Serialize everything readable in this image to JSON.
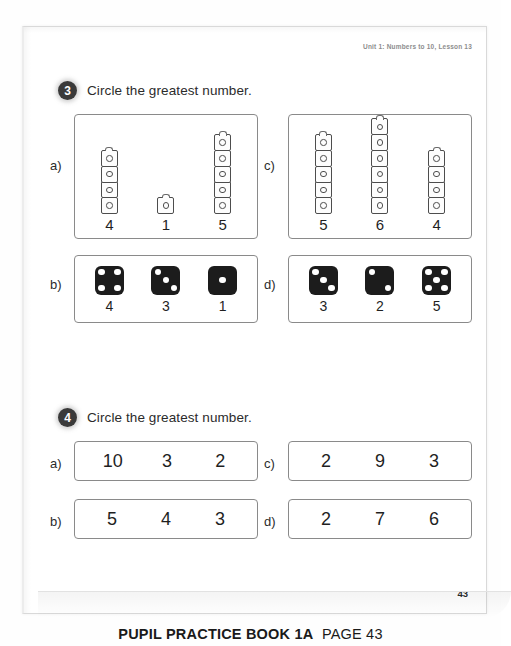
{
  "running_head": "Unit 1: Numbers to 10, Lesson 13",
  "folio": "43",
  "footer": {
    "book": "PUPIL PRACTICE BOOK 1A",
    "page": "PAGE 43"
  },
  "questions": [
    {
      "number": "3",
      "prompt": "Circle the greatest number.",
      "parts": [
        {
          "label": "a)",
          "type": "cubes",
          "items": [
            {
              "count": 4,
              "value": "4"
            },
            {
              "count": 1,
              "value": "1"
            },
            {
              "count": 5,
              "value": "5"
            }
          ]
        },
        {
          "label": "c)",
          "type": "cubes",
          "items": [
            {
              "count": 5,
              "value": "5"
            },
            {
              "count": 6,
              "value": "6"
            },
            {
              "count": 4,
              "value": "4"
            }
          ]
        },
        {
          "label": "b)",
          "type": "dice",
          "items": [
            {
              "count": 4,
              "value": "4"
            },
            {
              "count": 3,
              "value": "3"
            },
            {
              "count": 1,
              "value": "1"
            }
          ]
        },
        {
          "label": "d)",
          "type": "dice",
          "items": [
            {
              "count": 3,
              "value": "3"
            },
            {
              "count": 2,
              "value": "2"
            },
            {
              "count": 5,
              "value": "5"
            }
          ]
        }
      ]
    },
    {
      "number": "4",
      "prompt": "Circle the greatest number.",
      "parts": [
        {
          "label": "a)",
          "type": "numbers",
          "numbers": [
            "10",
            "3",
            "2"
          ]
        },
        {
          "label": "c)",
          "type": "numbers",
          "numbers": [
            "2",
            "9",
            "3"
          ]
        },
        {
          "label": "b)",
          "type": "numbers",
          "numbers": [
            "5",
            "4",
            "3"
          ]
        },
        {
          "label": "d)",
          "type": "numbers",
          "numbers": [
            "2",
            "7",
            "6"
          ]
        }
      ]
    }
  ]
}
